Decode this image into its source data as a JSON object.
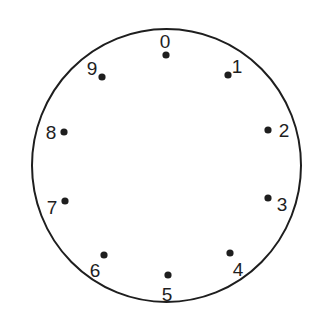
{
  "diagram": {
    "type": "rotary-dial",
    "colors": {
      "background": "#ffffff",
      "ink": "#1e1e1e"
    },
    "circle": {
      "cx": 166.5,
      "cy": 165.5,
      "rx": 134.5,
      "ry": 136.5
    },
    "positions": [
      {
        "label": "0",
        "dot": [
          166,
          55
        ],
        "text": [
          165,
          48
        ]
      },
      {
        "label": "1",
        "dot": [
          228,
          75
        ],
        "text": [
          237,
          73
        ]
      },
      {
        "label": "2",
        "dot": [
          268,
          130
        ],
        "text": [
          284,
          137
        ]
      },
      {
        "label": "3",
        "dot": [
          268,
          198
        ],
        "text": [
          282,
          211
        ]
      },
      {
        "label": "4",
        "dot": [
          230,
          253
        ],
        "text": [
          238,
          276
        ]
      },
      {
        "label": "5",
        "dot": [
          168,
          275
        ],
        "text": [
          167,
          301
        ]
      },
      {
        "label": "6",
        "dot": [
          104,
          255
        ],
        "text": [
          95,
          277
        ]
      },
      {
        "label": "7",
        "dot": [
          65,
          201
        ],
        "text": [
          52,
          214
        ]
      },
      {
        "label": "8",
        "dot": [
          64,
          132
        ],
        "text": [
          51,
          139
        ]
      },
      {
        "label": "9",
        "dot": [
          102,
          77
        ],
        "text": [
          92,
          75
        ]
      }
    ]
  }
}
